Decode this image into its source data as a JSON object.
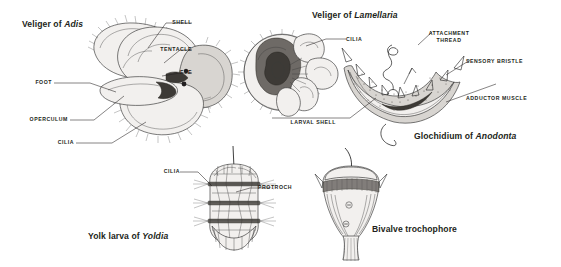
{
  "plate": {
    "description": "Scientific line-drawing plate of molluscan larval forms",
    "background_color": "#ffffff",
    "ink_color": "#231f20"
  },
  "figures": [
    {
      "id": "veliger-adis",
      "title_prefix": "Veliger of ",
      "title_genus": "Adis",
      "labels": [
        {
          "key": "shell",
          "text": "SHELL"
        },
        {
          "key": "tentacle",
          "text": "TENTACLE"
        },
        {
          "key": "eye",
          "text": "EYE"
        },
        {
          "key": "foot",
          "text": "FOOT"
        },
        {
          "key": "operculum",
          "text": "OPERCULUM"
        },
        {
          "key": "cilia",
          "text": "CILIA"
        }
      ]
    },
    {
      "id": "veliger-lamellaria",
      "title_prefix": "Veliger of ",
      "title_genus": "Lamellaria",
      "labels": [
        {
          "key": "cilia",
          "text": "CILIA"
        }
      ]
    },
    {
      "id": "glochidium-anodonta",
      "title_prefix": "Glochidium of ",
      "title_genus": "Anodonta",
      "labels": [
        {
          "key": "attachment_thread_1",
          "text": "ATTACHMENT"
        },
        {
          "key": "attachment_thread_2",
          "text": "THREAD"
        },
        {
          "key": "sensory_bristle",
          "text": "SENSORY BRISTLE"
        },
        {
          "key": "adductor_muscle",
          "text": "ADDUCTOR MUSCLE"
        },
        {
          "key": "larval_shell",
          "text": "LARVAL SHELL"
        }
      ]
    },
    {
      "id": "yolk-larva-yoldia",
      "title_prefix": "Yolk larva of ",
      "title_genus": "Yoldia",
      "labels": [
        {
          "key": "cilia",
          "text": "CILIA"
        },
        {
          "key": "protroch",
          "text": "PROTROCH"
        }
      ]
    },
    {
      "id": "bivalve-trochophore",
      "title_prefix": "Bivalve trochophore",
      "title_genus": "",
      "labels": []
    }
  ]
}
